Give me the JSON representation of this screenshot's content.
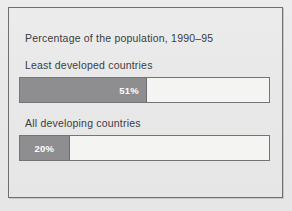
{
  "chart_data": {
    "type": "bar",
    "orientation": "horizontal",
    "title": "Percentage of the population, 1990–95",
    "xlabel": "",
    "ylabel": "",
    "xlim": [
      0,
      100
    ],
    "grid": false,
    "legend": "none",
    "categories": [
      "Least developed countries",
      "All developing countries"
    ],
    "values": [
      51,
      20
    ],
    "value_labels": [
      "51%",
      "20%"
    ],
    "bars": [
      {
        "label": "Least developed countries",
        "value": 51,
        "value_label": "51%"
      },
      {
        "label": "All developing countries",
        "value": 20,
        "value_label": "20%"
      }
    ],
    "colors": {
      "background": "#e9e9e9",
      "frame": "#6f6f72",
      "bar_fill": "#8e8e90",
      "bar_track": "#f4f4f3",
      "bar_border": "#73737a",
      "text": "#3b3b3e",
      "value_text": "#ffffff"
    }
  }
}
